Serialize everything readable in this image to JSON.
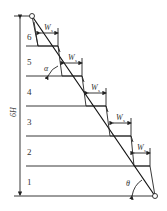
{
  "diagram": {
    "height_label": "6H",
    "levels": [
      "1",
      "2",
      "3",
      "4",
      "5",
      "6"
    ],
    "width_symbol": "W",
    "width_subscript": "s",
    "angle_alpha": "α",
    "angle_theta": "θ"
  }
}
